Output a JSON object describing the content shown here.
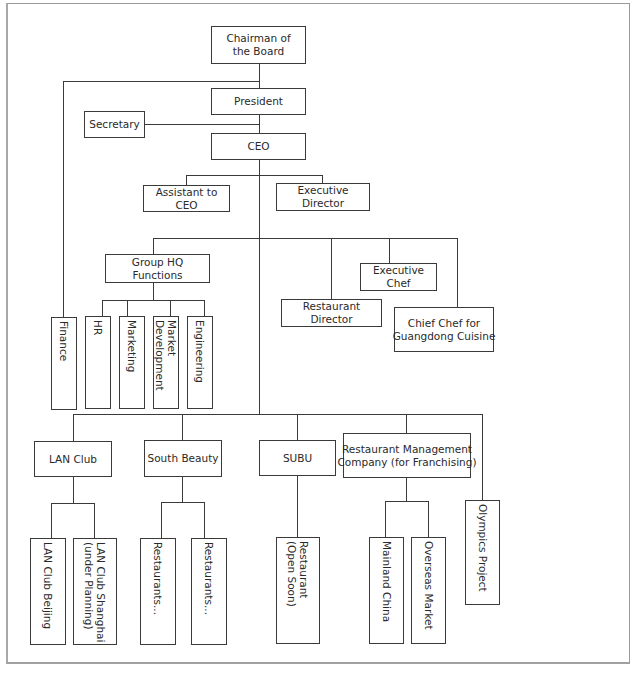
{
  "chart": {
    "type": "organizational-chart",
    "nodes": {
      "chairman": "Chairman of\nthe Board",
      "president": "President",
      "secretary": "Secretary",
      "ceo": "CEO",
      "assistant_to_ceo": "Assistant to CEO",
      "executive_director": "Executive Director",
      "group_hq_functions": "Group HQ Functions",
      "finance": "Finance",
      "hr": "HR",
      "marketing": "Marketing",
      "market_development": "Market\nDevelopment",
      "engineering": "Engineering",
      "restaurant_director": "Restaurant Director",
      "executive_chef": "Executive Chef",
      "chief_chef_guangdong": "Chief Chef for\nGuangdong Cuisine",
      "lan_club": "LAN Club",
      "south_beauty": "South Beauty",
      "subu": "SUBU",
      "restaurant_management_company": "Restaurant Management\nCompany (for Franchising)",
      "olympics_project": "Olympics Project",
      "lan_club_beijing": "LAN Club Beijing",
      "lan_club_shanghai": "LAN Club Shanghai\n(under Planning)",
      "south_beauty_restaurants_1": "Restaurants...",
      "south_beauty_restaurants_2": "Restaurants...",
      "subu_restaurant": "Restaurant\n(Open Soon)",
      "mainland_china": "Mainland China",
      "overseas_market": "Overseas Market"
    },
    "edges": [
      [
        "chairman",
        "president"
      ],
      [
        "chairman",
        "finance"
      ],
      [
        "president",
        "ceo"
      ],
      [
        "secretary",
        "ceo"
      ],
      [
        "ceo",
        "assistant_to_ceo"
      ],
      [
        "ceo",
        "executive_director"
      ],
      [
        "ceo",
        "group_hq_functions"
      ],
      [
        "ceo",
        "restaurant_director"
      ],
      [
        "ceo",
        "executive_chef"
      ],
      [
        "ceo",
        "chief_chef_guangdong"
      ],
      [
        "group_hq_functions",
        "hr"
      ],
      [
        "group_hq_functions",
        "marketing"
      ],
      [
        "group_hq_functions",
        "market_development"
      ],
      [
        "group_hq_functions",
        "engineering"
      ],
      [
        "ceo",
        "lan_club"
      ],
      [
        "ceo",
        "south_beauty"
      ],
      [
        "ceo",
        "subu"
      ],
      [
        "ceo",
        "restaurant_management_company"
      ],
      [
        "ceo",
        "olympics_project"
      ],
      [
        "lan_club",
        "lan_club_beijing"
      ],
      [
        "lan_club",
        "lan_club_shanghai"
      ],
      [
        "south_beauty",
        "south_beauty_restaurants_1"
      ],
      [
        "south_beauty",
        "south_beauty_restaurants_2"
      ],
      [
        "subu",
        "subu_restaurant"
      ],
      [
        "restaurant_management_company",
        "mainland_china"
      ],
      [
        "restaurant_management_company",
        "overseas_market"
      ]
    ]
  },
  "colors": {
    "line": "#3a3a3a",
    "frame": "#9a9a9a",
    "background": "#ffffff"
  }
}
